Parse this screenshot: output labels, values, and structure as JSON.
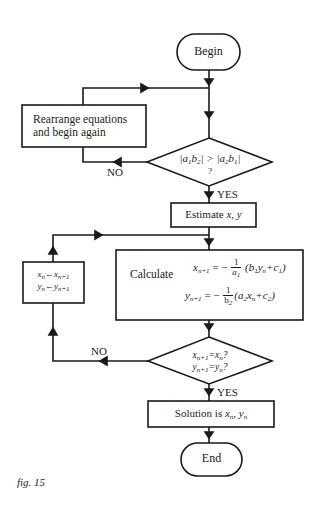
{
  "figure": {
    "caption": "fig. 15",
    "line_color": "#1a1a1a",
    "background": "#ffffff"
  },
  "nodes": {
    "begin": {
      "type": "terminal",
      "label": "Begin"
    },
    "rearrange": {
      "type": "process",
      "line1": "Rearrange equations",
      "line2": "and begin again"
    },
    "check_dominance": {
      "type": "decision",
      "line1": "|a1b2| > |a2b1|",
      "line2": "?"
    },
    "estimate": {
      "type": "process",
      "label_prefix": "Estimate ",
      "label_vars": "x, y"
    },
    "calculate": {
      "type": "process",
      "label": "Calculate",
      "eq1_lhs": "x",
      "eq1_lhs_sub": "n+1",
      "eq1_eq": "= −",
      "eq1_num": "1",
      "eq1_den": "a1",
      "eq1_rhs": "(b1yn+c1)",
      "eq2_lhs": "y",
      "eq2_lhs_sub": "n+1",
      "eq2_eq": "= −",
      "eq2_num": "1",
      "eq2_den": "b2",
      "eq2_rhs": "(a2xn+c2)"
    },
    "update": {
      "type": "process",
      "line1": "xn ← xn+1",
      "line2": "yn ← yn+1"
    },
    "check_convergence": {
      "type": "decision",
      "line1": "xn+1 = xn?",
      "line2": "yn+1 = yn?"
    },
    "solution": {
      "type": "process",
      "label_prefix": "Solution is ",
      "label_vars": "xn, yn"
    },
    "end": {
      "type": "terminal",
      "label": "End"
    }
  },
  "edges": {
    "dominance_no": "NO",
    "dominance_yes": "YES",
    "convergence_no": "NO",
    "convergence_yes": "YES"
  }
}
